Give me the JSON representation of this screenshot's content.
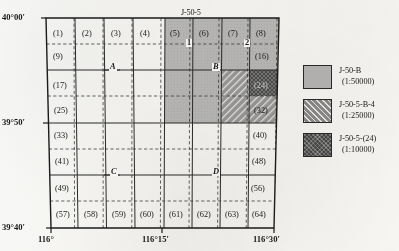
{
  "figure": {
    "type": "map",
    "title": "",
    "top_sheet_label": "J-50-5"
  },
  "axes": {
    "latitude_ticks": [
      "40°00′",
      "39°50′",
      "39°40′"
    ],
    "longitude_ticks": [
      "116°",
      "116°15′",
      "116°30′"
    ]
  },
  "grid": {
    "columns": 8,
    "rows": 8,
    "cell_labels": [
      "(1)",
      "(2)",
      "(3)",
      "(4)",
      "(5)",
      "(6)",
      "(7)",
      "(8)",
      "(9)",
      "(16)",
      "(17)",
      "(24)",
      "(25)",
      "(32)",
      "(33)",
      "(40)",
      "(41)",
      "(48)",
      "(49)",
      "(56)",
      "(57)",
      "(58)",
      "(59)",
      "(60)",
      "(61)",
      "(62)",
      "(63)",
      "(64)"
    ],
    "row1": [
      "(1)",
      "(2)",
      "(3)",
      "(4)",
      "(5)",
      "(6)",
      "(7)",
      "(8)"
    ],
    "row2_first": "(9)",
    "row2_last": "(16)",
    "row3_first": "(17)",
    "row3_last": "(24)",
    "row4_first": "(25)",
    "row4_last": "(32)",
    "row5_first": "(33)",
    "row5_last": "(40)",
    "row6_first": "(41)",
    "row6_last": "(48)",
    "row7_first": "(49)",
    "row7_last": "(56)",
    "row8": [
      "(57)",
      "(58)",
      "(59)",
      "(60)",
      "(61)",
      "(62)",
      "(63)",
      "(64)"
    ]
  },
  "markers": {
    "point_1": "1",
    "point_2": "2",
    "point_A": "A",
    "point_B": "B",
    "point_C": "C",
    "point_D": "D"
  },
  "legend": {
    "items": [
      {
        "name": "J-50-B",
        "scale": "(1:50000)",
        "pattern": "solid-light-gray",
        "color": "#b9b9b9"
      },
      {
        "name": "J-50-5-B-4",
        "scale": "(1:25000)",
        "pattern": "diagonal-hatch",
        "color": "#8d8d8d"
      },
      {
        "name": "J-50-5-(24)",
        "scale": "(1:10000)",
        "pattern": "cross-hatch",
        "color": "#4a4a4a"
      }
    ]
  }
}
